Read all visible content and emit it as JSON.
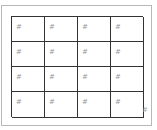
{
  "grid": {
    "rows": 4,
    "columns": 4,
    "cells": [
      [
        "#",
        "#",
        "#",
        "#"
      ],
      [
        "#",
        "#",
        "#",
        "#"
      ],
      [
        "#",
        "#",
        "#",
        "#"
      ],
      [
        "#",
        "#",
        "#",
        "#"
      ]
    ]
  },
  "corner_handle": {
    "label": "#"
  },
  "colors": {
    "frame_border": "#b8b8b8",
    "grid_border": "#333333",
    "cell_text": "#9a9a9a"
  }
}
